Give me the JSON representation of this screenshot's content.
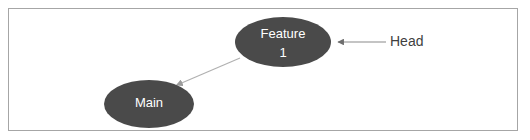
{
  "frame": {
    "border_color": "#a6a6a6",
    "background_color": "#ffffff"
  },
  "diagram": {
    "type": "node-link-diagram",
    "node_fill_color": "#4a4a4a",
    "node_text_color": "#ffffff",
    "edge_color": "#b0b0b0",
    "annotation_color": "#3f3f3f",
    "nodes": [
      {
        "id": "feature1",
        "label_line1": "Feature",
        "label_line2": "1",
        "shape": "ellipse",
        "cx": 283,
        "cy": 42,
        "rx": 48,
        "ry": 25
      },
      {
        "id": "main",
        "label_line1": "Main",
        "label_line2": "",
        "shape": "ellipse",
        "cx": 149,
        "cy": 104,
        "rx": 45,
        "ry": 24
      }
    ],
    "edges": [
      {
        "id": "feature1-to-main",
        "from": "feature1",
        "to": "main",
        "arrowhead_at": "main",
        "x1": 240,
        "y1": 58,
        "x2": 175,
        "y2": 86
      }
    ],
    "annotations": [
      {
        "id": "head-callout",
        "label": "Head",
        "points_to": "feature1",
        "line_x1": 386,
        "line_y1": 42,
        "line_x2": 336,
        "line_y2": 42,
        "text_x": 390,
        "text_y": 42
      }
    ]
  }
}
